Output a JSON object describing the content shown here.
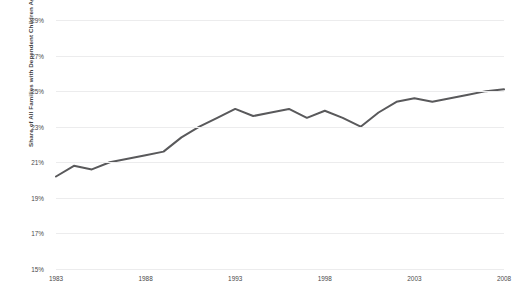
{
  "chart_data": {
    "type": "line",
    "title": "",
    "xlabel": "",
    "ylabel": "Share of All Families with Dependent Children Age 18 or Less",
    "ylim": [
      15,
      29
    ],
    "xlim": [
      1983,
      2008
    ],
    "grid": true,
    "legend": false,
    "ytick_labels": [
      "29%",
      "27%",
      "25%",
      "23%",
      "21%",
      "19%",
      "17%",
      "15%"
    ],
    "ytick_values": [
      29,
      27,
      25,
      23,
      21,
      19,
      17,
      15
    ],
    "xtick_labels": [
      "1983",
      "1988",
      "1993",
      "1998",
      "2003",
      "2008"
    ],
    "xtick_values": [
      1983,
      1988,
      1993,
      1998,
      2003,
      2008
    ],
    "series": [
      {
        "name": "Share of all families with dependent children age 18 or less",
        "color": "#59595b",
        "x": [
          1983,
          1984,
          1985,
          1986,
          1987,
          1988,
          1989,
          1990,
          1991,
          1992,
          1993,
          1994,
          1995,
          1996,
          1997,
          1998,
          1999,
          2000,
          2001,
          2002,
          2003,
          2004,
          2005,
          2006,
          2007,
          2008
        ],
        "values": [
          20.2,
          20.8,
          20.6,
          21.0,
          21.2,
          21.4,
          21.6,
          22.4,
          23.0,
          23.5,
          24.0,
          23.6,
          23.8,
          24.0,
          23.5,
          23.9,
          23.5,
          23.0,
          23.8,
          24.4,
          24.6,
          24.4,
          24.6,
          24.8,
          25.0,
          25.1
        ]
      }
    ]
  },
  "caption": {
    "text": ""
  }
}
